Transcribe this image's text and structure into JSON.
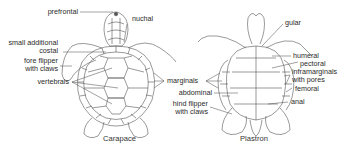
{
  "figure": {
    "panels": [
      {
        "caption": "Carapace",
        "labels": {
          "prefrontal": "prefrontal",
          "nuchal": "nuchal",
          "small_additional_costal_1": "small additional",
          "small_additional_costal_2": "costal",
          "fore_flipper_1": "fore flipper",
          "fore_flipper_2": "with claws",
          "vertebrals": "vertebrals",
          "marginals": "marginals"
        }
      },
      {
        "caption": "Plastron",
        "labels": {
          "gular": "gular",
          "humeral": "humeral",
          "pectoral": "pectoral",
          "inframarginals_1": "inframarginals",
          "inframarginals_2": "with pores",
          "abdominal": "abdominal",
          "hind_flipper_1": "hind flipper",
          "hind_flipper_2": "with claws",
          "femoral": "femoral",
          "anal": "anal"
        }
      }
    ],
    "colors": {
      "line": "#555555",
      "background": "#ffffff"
    }
  }
}
